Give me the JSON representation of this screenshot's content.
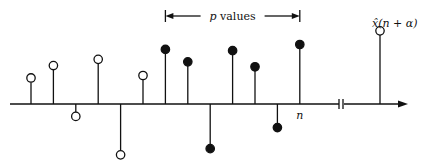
{
  "labels": {
    "span": "p values",
    "span_italic_part": "p",
    "span_rest": " values",
    "current_index": "n",
    "predicted_sample": "x̂(n + α)"
  },
  "samples": [
    {
      "index": 0,
      "value": 0.42,
      "marker": "open"
    },
    {
      "index": 1,
      "value": 0.62,
      "marker": "open"
    },
    {
      "index": 2,
      "value": -0.2,
      "marker": "open"
    },
    {
      "index": 3,
      "value": 0.72,
      "marker": "open"
    },
    {
      "index": 4,
      "value": -0.82,
      "marker": "open"
    },
    {
      "index": 5,
      "value": 0.46,
      "marker": "open"
    },
    {
      "index": 6,
      "value": 0.88,
      "marker": "filled"
    },
    {
      "index": 7,
      "value": 0.68,
      "marker": "filled"
    },
    {
      "index": 8,
      "value": -0.72,
      "marker": "filled"
    },
    {
      "index": 9,
      "value": 0.86,
      "marker": "filled"
    },
    {
      "index": 10,
      "value": 0.6,
      "marker": "filled"
    },
    {
      "index": 11,
      "value": -0.38,
      "marker": "filled"
    },
    {
      "index": 12,
      "value": 0.96,
      "marker": "filled"
    }
  ],
  "predicted": {
    "value": 1.18,
    "marker": "open"
  },
  "span_range": {
    "from_index": 6,
    "to_index": 12
  },
  "current_index_position": 12,
  "axis": {
    "has_break": true,
    "has_arrow": true
  }
}
